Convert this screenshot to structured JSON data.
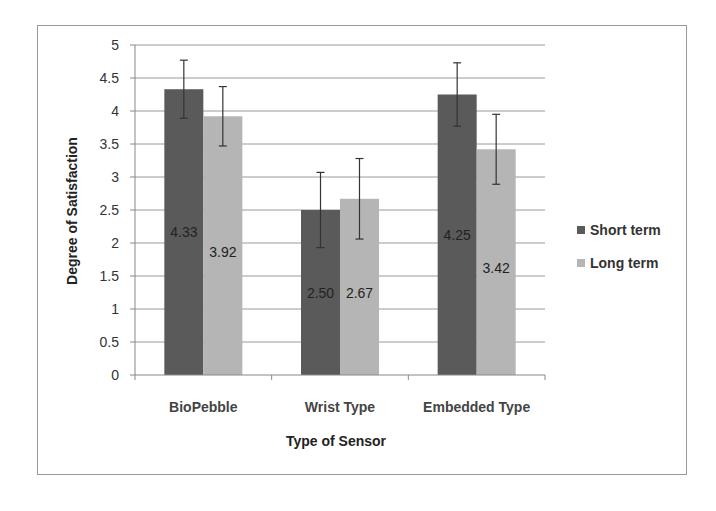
{
  "chart_data": {
    "type": "bar",
    "title": "",
    "xlabel": "Type of Sensor",
    "ylabel": "Degree of Satisfaction",
    "ylim": [
      0,
      5
    ],
    "yticks": [
      0,
      0.5,
      1,
      1.5,
      2,
      2.5,
      3,
      3.5,
      4,
      4.5,
      5
    ],
    "ytick_labels": [
      "0",
      "0.5",
      "1",
      "1.5",
      "2",
      "2.5",
      "3",
      "3.5",
      "4",
      "4.5",
      "5"
    ],
    "grid": true,
    "legend_position": "right",
    "categories": [
      "BioPebble",
      "Wrist Type",
      "Embedded Type"
    ],
    "series": [
      {
        "name": "Short term",
        "color": "#5a5a5a",
        "values": [
          4.33,
          2.5,
          4.25
        ],
        "value_labels": [
          "4.33",
          "2.50",
          "4.25"
        ],
        "error": [
          0.44,
          0.57,
          0.48
        ]
      },
      {
        "name": "Long term",
        "color": "#b5b5b5",
        "values": [
          3.92,
          2.67,
          3.42
        ],
        "value_labels": [
          "3.92",
          "2.67",
          "3.42"
        ],
        "error": [
          0.45,
          0.61,
          0.53
        ]
      }
    ]
  }
}
